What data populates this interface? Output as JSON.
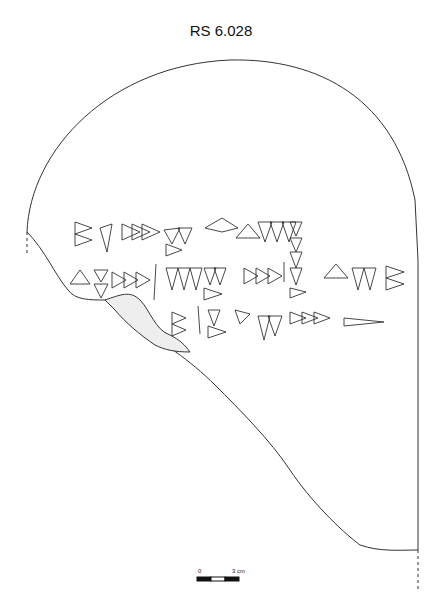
{
  "title": "RS 6.028",
  "scale_bar": {
    "start_label": "0",
    "end_label": "3 cm"
  },
  "drawing": {
    "description": "Cuneiform tablet fragment outline drawing with three lines of wedge signs",
    "line_count": 3,
    "stroke_color": "#333333",
    "background": "#ffffff"
  }
}
